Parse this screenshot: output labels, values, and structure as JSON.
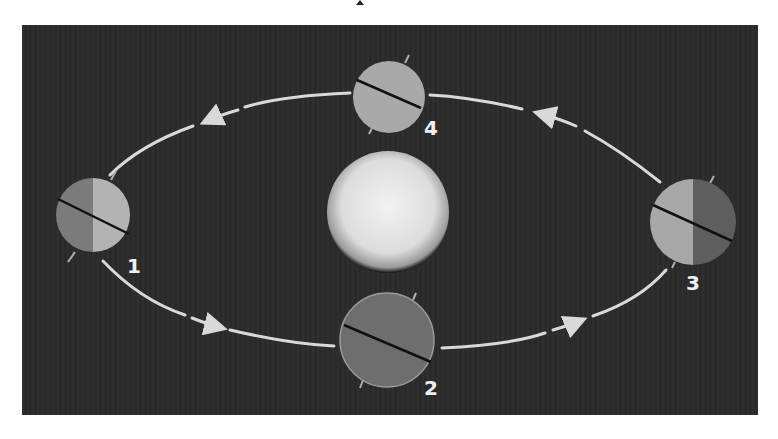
{
  "diagram": {
    "type": "orbit-seasons",
    "background_color": "#2b2b2b",
    "orbit_color": "#d9d9d9",
    "sun": {
      "name": "sun",
      "cx": 388,
      "cy": 212,
      "r": 60
    },
    "earth_positions": [
      {
        "label": "1",
        "cx": 93,
        "cy": 215,
        "r": 37,
        "lit_side": "right",
        "label_x": 127,
        "label_y": 273
      },
      {
        "label": "2",
        "cx": 387,
        "cy": 340,
        "r": 47,
        "lit_side": "none",
        "label_x": 424,
        "label_y": 393
      },
      {
        "label": "3",
        "cx": 693,
        "cy": 222,
        "r": 43,
        "lit_side": "left",
        "label_x": 686,
        "label_y": 290
      },
      {
        "label": "4",
        "cx": 389,
        "cy": 97,
        "r": 36,
        "lit_side": "full",
        "label_x": 424,
        "label_y": 134
      }
    ],
    "orbit_direction": "counter-clockwise (as viewed: 1 → 2 → 3 → 4)"
  }
}
